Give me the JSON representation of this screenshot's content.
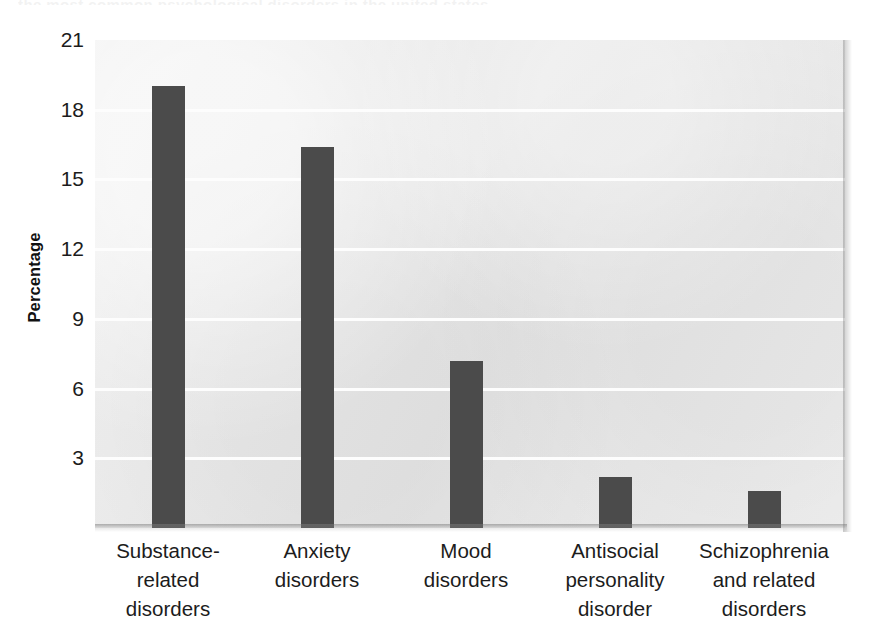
{
  "figure": {
    "top_cropped_sliver_text": "the most common psychological disorders in the united states",
    "y_axis_title": "Percentage",
    "bar_color": "#4b4b4b",
    "plot_background_color": "#e9e9e9",
    "gridline_color": "#fdfdfd"
  },
  "chart_data": {
    "type": "bar",
    "title": "",
    "xlabel": "",
    "ylabel": "Percentage",
    "categories": [
      "Substance-related disorders",
      "Anxiety disorders",
      "Mood disorders",
      "Antisocial personality disorder",
      "Schizophrenia and related disorders"
    ],
    "category_lines": [
      [
        "Substance-",
        "related",
        "disorders"
      ],
      [
        "Anxiety",
        "disorders"
      ],
      [
        "Mood",
        "disorders"
      ],
      [
        "Antisocial",
        "personality",
        "disorder"
      ],
      [
        "Schizophrenia",
        "and related",
        "disorders"
      ]
    ],
    "values": [
      19.0,
      16.4,
      7.2,
      2.2,
      1.6
    ],
    "ylim": [
      0,
      21
    ],
    "yticks": [
      21,
      18,
      15,
      12,
      9,
      6,
      3
    ],
    "ytick_labels": [
      "21",
      "18",
      "15",
      "12",
      "9",
      "6",
      "3"
    ],
    "grid": true,
    "grid_axis": "y",
    "legend": "none",
    "series": [
      {
        "name": "Percentage",
        "values": [
          19.0,
          16.4,
          7.2,
          2.2,
          1.6
        ]
      }
    ]
  },
  "layout": {
    "bar_centers_px": [
      168,
      317,
      466,
      615,
      764
    ],
    "bar_width_px": 33,
    "plot": {
      "left": 95,
      "top": 40,
      "width": 750,
      "height": 488,
      "baseline_value": 0,
      "top_value": 21.0
    }
  }
}
